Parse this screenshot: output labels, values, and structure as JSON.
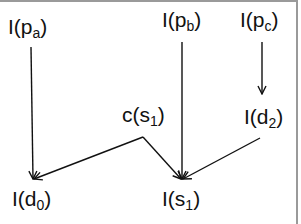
{
  "diagram": {
    "nodes": [
      {
        "id": "I_pa",
        "prefix": "I(p",
        "sub": "a",
        "suffix": ")"
      },
      {
        "id": "I_pb",
        "prefix": "I(p",
        "sub": "b",
        "suffix": ")"
      },
      {
        "id": "I_pc",
        "prefix": "I(p",
        "sub": "c",
        "suffix": ")"
      },
      {
        "id": "c_s1",
        "prefix": "c(s",
        "sub": "1",
        "suffix": ")"
      },
      {
        "id": "I_d2",
        "prefix": "I(d",
        "sub": "2",
        "suffix": ")"
      },
      {
        "id": "I_d0",
        "prefix": "I(d",
        "sub": "0",
        "suffix": ")"
      },
      {
        "id": "I_s1",
        "prefix": "I(s",
        "sub": "1",
        "suffix": ")"
      }
    ],
    "edges": [
      {
        "from": "I(pa)",
        "to": "I(d0)"
      },
      {
        "from": "I(pb)",
        "to": "I(s1)"
      },
      {
        "from": "I(pc)",
        "to": "I(d2)"
      },
      {
        "from": "c(s1)",
        "to": "I(d0)"
      },
      {
        "from": "c(s1)",
        "to": "I(s1)"
      },
      {
        "from": "I(d2)",
        "to": "I(s1)"
      }
    ],
    "colors": {
      "line": "#111111",
      "frame": "#9a9a9a",
      "background": "#ffffff"
    }
  }
}
